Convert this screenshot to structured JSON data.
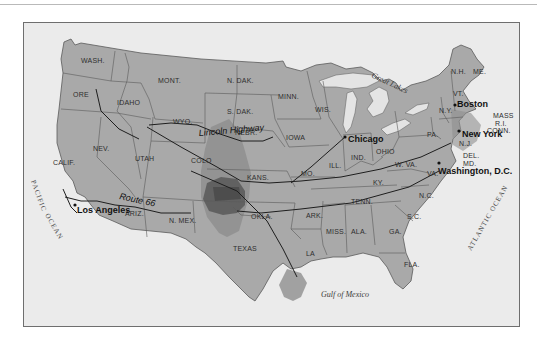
{
  "map": {
    "type": "United States route map",
    "states": {
      "wash": "WASH.",
      "ore": "ORE",
      "idaho": "IDAHO",
      "mont": "MONT.",
      "wyo": "WYO.",
      "calif": "CALIF.",
      "nev": "NEV.",
      "utah": "UTAH",
      "colo": "COLO",
      "ariz": "ARIZ.",
      "nmex": "N. MEX.",
      "ndak": "N. DAK.",
      "sdak": "S. DAK.",
      "nebr": "NEBR.",
      "kans": "KANS.",
      "okla": "OKLA.",
      "texas": "TEXAS",
      "minn": "MINN.",
      "iowa": "IOWA",
      "mo": "MO.",
      "ark": "ARK.",
      "la": "LA",
      "wis": "WIS.",
      "ill": "ILL.",
      "ind": "IND.",
      "ohio": "OHIO",
      "ky": "KY.",
      "tenn": "TENN.",
      "miss": "MISS.",
      "ala": "ALA.",
      "ga": "GA.",
      "fla": "FLA.",
      "sc": "S.C.",
      "nc": "N.C.",
      "va": "VA.",
      "wva": "W. VA.",
      "pa": "PA.",
      "ny": "N.Y.",
      "vt": "VT.",
      "nh": "N.H.",
      "me": "ME.",
      "mass": "MASS",
      "ri": "R.I.",
      "conn": "CONN.",
      "nj": "N.J.",
      "del": "DEL.",
      "md": "MD."
    },
    "cities": {
      "chicago": "Chicago",
      "boston": "Boston",
      "new_york": "New York",
      "washington": "Washington, D.C.",
      "los_angeles": "Los Angeles"
    },
    "routes": {
      "lincoln": "Lincoln Highway",
      "route66": "Route 66"
    },
    "water": {
      "great_lakes": "Great Lakes",
      "gulf": "Gulf of Mexico",
      "pacific": "PACIFIC OCEAN",
      "pacific_1": "PACIFIC",
      "pacific_2": "OCEAN",
      "atlantic": "ATLANTIC OCEAN"
    },
    "colors": {
      "land": "#a9a9a9",
      "water_bg": "#ebebeb",
      "lakes": "#e4e4e4",
      "shade_light": "#8f8f8f",
      "shade_dark": "#5c5c5c",
      "shade_darkest": "#454545",
      "border": "#5a5a5a",
      "route": "#1e1e1e"
    }
  }
}
